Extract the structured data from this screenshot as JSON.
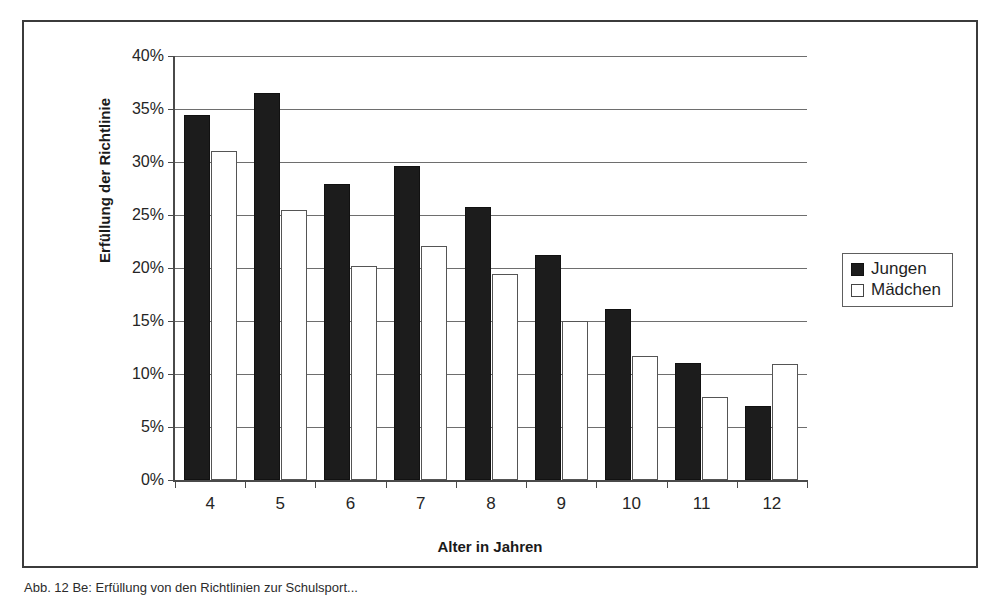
{
  "figure": {
    "caption": "Abb. 12 Be: Erfüllung von den Richtlinien zur Schulsport..."
  },
  "legend": {
    "position": "right",
    "entries": [
      {
        "label": "Jungen",
        "color": "#1c1c1c",
        "swatch": "filled-square-icon"
      },
      {
        "label": "Mädchen",
        "color": "#ffffff",
        "swatch": "empty-square-icon"
      }
    ]
  },
  "axes": {
    "y_title": "Erfüllung der Richtlinie",
    "x_title": "Alter in Jahren",
    "y_ticks": [
      "0%",
      "5%",
      "10%",
      "15%",
      "20%",
      "25%",
      "30%",
      "35%",
      "40%"
    ],
    "x_ticks": [
      "4",
      "5",
      "6",
      "7",
      "8",
      "9",
      "10",
      "11",
      "12"
    ]
  },
  "chart_data": {
    "type": "bar",
    "title": "",
    "subtitle": "",
    "xlabel": "Alter in Jahren",
    "ylabel": "Erfüllung der Richtlinie",
    "categories": [
      "4",
      "5",
      "6",
      "7",
      "8",
      "9",
      "10",
      "11",
      "12"
    ],
    "series": [
      {
        "name": "Jungen",
        "color": "#1c1c1c",
        "values": [
          34.4,
          36.5,
          27.9,
          29.6,
          25.8,
          21.2,
          16.1,
          11.0,
          7.0
        ]
      },
      {
        "name": "Mädchen",
        "color": "#ffffff",
        "values": [
          31.0,
          25.5,
          20.2,
          22.1,
          19.4,
          15.0,
          11.7,
          7.8,
          10.9
        ]
      }
    ],
    "ylim": [
      0,
      40
    ],
    "ytick_values": [
      0,
      5,
      10,
      15,
      20,
      25,
      30,
      35,
      40
    ],
    "ytick_format": "percent",
    "grid": true,
    "grid_axis": "y",
    "legend_position": "right"
  }
}
